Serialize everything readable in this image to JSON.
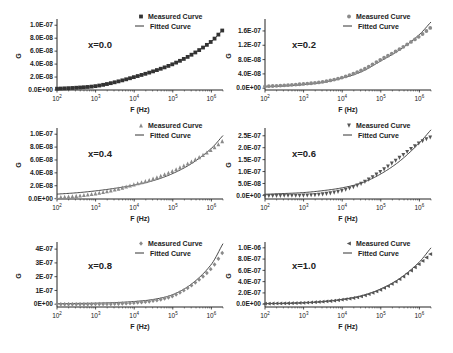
{
  "figure": {
    "x_axis_label": "F (Hz)",
    "y_axis_label": "G",
    "x_ticks": [
      "10^2",
      "10^3",
      "10^4",
      "10^5",
      "10^6"
    ],
    "legend": {
      "measured": "Measured Curve",
      "fitted": "Fitted Curve"
    },
    "colors": {
      "measured_dark": "#333333",
      "measured_gray": "#8a8a8a",
      "fitted": "#333333",
      "axis": "#222222",
      "text": "#222222"
    }
  },
  "chart_data": [
    {
      "type": "line",
      "title": "x=0.0",
      "xlabel": "F (Hz)",
      "ylabel": "G",
      "xscale": "log",
      "xlim": [
        100,
        2000000
      ],
      "ylim": [
        0,
        1.05e-07
      ],
      "yticks": [
        0,
        2e-08,
        4e-08,
        6e-08,
        8e-08,
        1e-07
      ],
      "ytick_labels": [
        "0.0E+00",
        "2.0E-08",
        "4.0E-08",
        "6.0E-08",
        "8.0E-08",
        "1.0E-07"
      ],
      "marker": "square",
      "legend_position": "upper right",
      "grid": false,
      "series": [
        {
          "name": "Measured Curve",
          "x_log10": [
            2.0,
            2.5,
            3.0,
            3.5,
            4.0,
            4.5,
            5.0,
            5.5,
            6.0,
            6.3
          ],
          "values": [
            2e-09,
            3.5e-09,
            6e-09,
            1.2e-08,
            2e-08,
            2.9e-08,
            4e-08,
            5.5e-08,
            7.5e-08,
            9.3e-08
          ]
        },
        {
          "name": "Fitted Curve",
          "x_log10": [
            2.0,
            2.5,
            3.0,
            3.5,
            4.0,
            4.5,
            5.0,
            5.5,
            6.0,
            6.3
          ],
          "values": [
            2e-09,
            3.5e-09,
            6e-09,
            1.2e-08,
            2e-08,
            2.9e-08,
            4e-08,
            5.5e-08,
            7.5e-08,
            9.3e-08
          ]
        }
      ]
    },
    {
      "type": "line",
      "title": "x=0.2",
      "xlabel": "F (Hz)",
      "ylabel": "G",
      "xscale": "log",
      "xlim": [
        100,
        2000000
      ],
      "ylim": [
        -5e-09,
        1.85e-07
      ],
      "yticks": [
        0,
        4e-08,
        8e-08,
        1.2e-07,
        1.6e-07
      ],
      "ytick_labels": [
        "0.0E+00",
        "4.0E-08",
        "8.0E-08",
        "1.2E-07",
        "1.6E-07"
      ],
      "marker": "circle",
      "legend_position": "upper right",
      "grid": false,
      "series": [
        {
          "name": "Measured Curve",
          "x_log10": [
            2.0,
            2.5,
            3.0,
            3.5,
            4.0,
            4.5,
            5.0,
            5.5,
            6.0,
            6.3
          ],
          "values": [
            5e-09,
            8e-09,
            1.2e-08,
            1.8e-08,
            3e-08,
            5e-08,
            8e-08,
            1.1e-07,
            1.45e-07,
            1.7e-07
          ]
        },
        {
          "name": "Fitted Curve",
          "x_log10": [
            2.0,
            2.5,
            3.0,
            3.5,
            4.0,
            4.5,
            5.0,
            5.5,
            6.0,
            6.3
          ],
          "values": [
            4e-09,
            6e-09,
            1e-08,
            1.6e-08,
            2.8e-08,
            4.6e-08,
            7.6e-08,
            1.08e-07,
            1.5e-07,
            1.85e-07
          ]
        }
      ]
    },
    {
      "type": "line",
      "title": "x=0.4",
      "xlabel": "F (Hz)",
      "ylabel": "G",
      "xscale": "log",
      "xlim": [
        100,
        2000000
      ],
      "ylim": [
        -6e-10,
        1.05e-07
      ],
      "yticks": [
        0,
        2e-08,
        4e-08,
        6e-08,
        8e-08,
        1e-07
      ],
      "ytick_labels": [
        "0.0E+00",
        "2.0E-08",
        "4.0E-08",
        "6.0E-08",
        "8.0E-08",
        "1.0E-07"
      ],
      "marker": "triangle-up",
      "legend_position": "upper right",
      "grid": false,
      "series": [
        {
          "name": "Measured Curve",
          "x_log10": [
            2.0,
            2.5,
            3.0,
            3.5,
            4.0,
            4.5,
            5.0,
            5.5,
            6.0,
            6.3
          ],
          "values": [
            2e-09,
            4e-09,
            8e-09,
            1.4e-08,
            2.2e-08,
            3.1e-08,
            4.3e-08,
            5.8e-08,
            7.6e-08,
            9e-08
          ]
        },
        {
          "name": "Fitted Curve",
          "x_log10": [
            2.0,
            2.5,
            3.0,
            3.5,
            4.0,
            4.5,
            5.0,
            5.5,
            6.0,
            6.3
          ],
          "values": [
            7e-09,
            9e-09,
            1.2e-08,
            1.6e-08,
            2.1e-08,
            2.8e-08,
            3.9e-08,
            5.5e-08,
            7.8e-08,
            9.8e-08
          ]
        }
      ]
    },
    {
      "type": "line",
      "title": "x=0.6",
      "xlabel": "F (Hz)",
      "ylabel": "G",
      "xscale": "log",
      "xlim": [
        100,
        2000000
      ],
      "ylim": [
        -1.5e-08,
        2.7e-07
      ],
      "yticks": [
        0,
        5e-08,
        1e-07,
        1.5e-07,
        2e-07,
        2.5e-07
      ],
      "ytick_labels": [
        "0.0E+00",
        "5.0E-08",
        "1.0E-07",
        "1.5E-07",
        "2.0E-07",
        "2.5E-07"
      ],
      "marker": "triangle-down",
      "legend_position": "upper right",
      "grid": false,
      "series": [
        {
          "name": "Measured Curve",
          "x_log10": [
            2.0,
            2.5,
            3.0,
            3.5,
            4.0,
            4.5,
            5.0,
            5.5,
            6.0,
            6.3
          ],
          "values": [
            -2e-09,
            -1e-09,
            0,
            5e-09,
            2e-08,
            5e-08,
            1e-07,
            1.6e-07,
            2.2e-07,
            2.45e-07
          ]
        },
        {
          "name": "Fitted Curve",
          "x_log10": [
            2.0,
            2.5,
            3.0,
            3.5,
            4.0,
            4.5,
            5.0,
            5.5,
            6.0,
            6.3
          ],
          "values": [
            5e-09,
            8e-09,
            1.2e-08,
            2e-08,
            3.2e-08,
            5.2e-08,
            9e-08,
            1.45e-07,
            2.2e-07,
            2.75e-07
          ]
        }
      ]
    },
    {
      "type": "line",
      "title": "x=0.8",
      "xlabel": "F (Hz)",
      "ylabel": "G",
      "xscale": "log",
      "xlim": [
        100,
        2000000
      ],
      "ylim": [
        -2e-08,
        4.3e-07
      ],
      "yticks": [
        0,
        1e-07,
        2e-07,
        3e-07,
        4e-07
      ],
      "ytick_labels": [
        "0E+00",
        "1E-07",
        "2E-07",
        "3E-07",
        "4E-07"
      ],
      "marker": "diamond",
      "legend_position": "upper right",
      "grid": false,
      "series": [
        {
          "name": "Measured Curve",
          "x_log10": [
            2.0,
            2.5,
            3.0,
            3.5,
            4.0,
            4.5,
            5.0,
            5.5,
            6.0,
            6.3
          ],
          "values": [
            0,
            0,
            1e-09,
            3e-09,
            1e-08,
            2.5e-08,
            6e-08,
            1.4e-07,
            2.6e-07,
            3.8e-07
          ]
        },
        {
          "name": "Fitted Curve",
          "x_log10": [
            2.0,
            2.5,
            3.0,
            3.5,
            4.0,
            4.5,
            5.0,
            5.5,
            6.0,
            6.3
          ],
          "values": [
            5e-09,
            6e-09,
            8e-09,
            1.2e-08,
            2e-08,
            3.5e-08,
            7e-08,
            1.5e-07,
            2.9e-07,
            4.4e-07
          ]
        }
      ]
    },
    {
      "type": "line",
      "title": "x=1.0",
      "xlabel": "F (Hz)",
      "ylabel": "G",
      "xscale": "log",
      "xlim": [
        100,
        2000000
      ],
      "ylim": [
        -5e-08,
        1.05e-06
      ],
      "yticks": [
        0,
        2e-07,
        4e-07,
        6e-07,
        8e-07,
        1e-06
      ],
      "ytick_labels": [
        "0.0E+00",
        "2.0E-07",
        "4.0E-07",
        "6.0E-07",
        "8.0E-07",
        "1.0E-06"
      ],
      "marker": "triangle-left",
      "legend_position": "upper right",
      "grid": false,
      "series": [
        {
          "name": "Measured Curve",
          "x_log10": [
            2.0,
            2.5,
            3.0,
            3.5,
            4.0,
            4.5,
            5.0,
            5.5,
            6.0,
            6.3
          ],
          "values": [
            1e-08,
            1.5e-08,
            2.5e-08,
            4.5e-08,
            8e-08,
            1.4e-07,
            2.6e-07,
            4.5e-07,
            7.2e-07,
            9e-07
          ]
        },
        {
          "name": "Fitted Curve",
          "x_log10": [
            2.0,
            2.5,
            3.0,
            3.5,
            4.0,
            4.5,
            5.0,
            5.5,
            6.0,
            6.3
          ],
          "values": [
            1e-08,
            1.5e-08,
            2.5e-08,
            4.5e-08,
            8.5e-08,
            1.5e-07,
            2.7e-07,
            4.6e-07,
            7.5e-07,
            1e-06
          ]
        }
      ]
    }
  ],
  "layout": {
    "panels": [
      {
        "id": "p00",
        "left": 57,
        "top": 22,
        "width": 166,
        "height": 68
      },
      {
        "id": "p02",
        "left": 265,
        "top": 22,
        "width": 166,
        "height": 68
      },
      {
        "id": "p04",
        "left": 57,
        "top": 131,
        "width": 166,
        "height": 68
      },
      {
        "id": "p06",
        "left": 265,
        "top": 131,
        "width": 166,
        "height": 68
      },
      {
        "id": "p08",
        "left": 57,
        "top": 245,
        "width": 166,
        "height": 62
      },
      {
        "id": "p10",
        "left": 265,
        "top": 245,
        "width": 166,
        "height": 62
      }
    ]
  }
}
